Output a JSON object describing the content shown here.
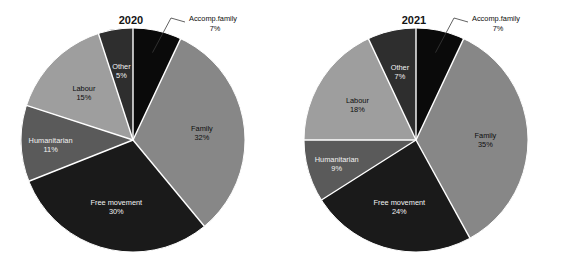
{
  "chart_data": [
    {
      "type": "pie",
      "title": "2020",
      "categories": [
        "Accomp.family",
        "Family",
        "Free movement",
        "Humanitarian",
        "Labour",
        "Other"
      ],
      "values": [
        7,
        32,
        30,
        11,
        15,
        5
      ],
      "value_labels": [
        "7%",
        "32%",
        "30%",
        "11%",
        "15%",
        "5%"
      ],
      "colors": [
        "#0a0a0a",
        "#878787",
        "#1a1a1a",
        "#5a5a5a",
        "#9e9e9e",
        "#2e2e2e"
      ],
      "label_text_colors": [
        "#0d0d0d",
        "#0d0d0d",
        "#f2f2f2",
        "#f2f2f2",
        "#0d0d0d",
        "#f2f2f2"
      ],
      "legend": "none",
      "grid": false,
      "start_angle_deg": 0,
      "direction": "clockwise"
    },
    {
      "type": "pie",
      "title": "2021",
      "categories": [
        "Accomp.family",
        "Family",
        "Free movement",
        "Humanitarian",
        "Labour",
        "Other"
      ],
      "values": [
        7,
        35,
        24,
        9,
        18,
        7
      ],
      "value_labels": [
        "7%",
        "35%",
        "24%",
        "9%",
        "18%",
        "7%"
      ],
      "colors": [
        "#0a0a0a",
        "#878787",
        "#1a1a1a",
        "#5a5a5a",
        "#9e9e9e",
        "#2e2e2e"
      ],
      "label_text_colors": [
        "#0d0d0d",
        "#0d0d0d",
        "#f2f2f2",
        "#f2f2f2",
        "#0d0d0d",
        "#f2f2f2"
      ],
      "legend": "none",
      "grid": false,
      "start_angle_deg": 0,
      "direction": "clockwise"
    }
  ],
  "figure": {
    "background": "#ffffff",
    "separator_color": "#ffffff",
    "title_color": "#141414"
  },
  "charts": [
    {
      "id": "chart-2020",
      "title": "2020",
      "slices": [
        {
          "name": "Accomp.family",
          "label": "Accomp.family",
          "percent": "7%",
          "color": "#0a0a0a",
          "placement": "outside"
        },
        {
          "name": "Family",
          "label": "Family",
          "percent": "32%",
          "color": "#878787",
          "placement": "inside-light"
        },
        {
          "name": "Free movement",
          "label": "Free movement",
          "percent": "30%",
          "color": "#1a1a1a",
          "placement": "inside-dark"
        },
        {
          "name": "Humanitarian",
          "label": "Humanitarian",
          "percent": "11%",
          "color": "#5a5a5a",
          "placement": "inside-dark"
        },
        {
          "name": "Labour",
          "label": "Labour",
          "percent": "15%",
          "color": "#9e9e9e",
          "placement": "inside-light"
        },
        {
          "name": "Other",
          "label": "Other",
          "percent": "5%",
          "color": "#2e2e2e",
          "placement": "inside-dark"
        }
      ]
    },
    {
      "id": "chart-2021",
      "title": "2021",
      "slices": [
        {
          "name": "Accomp.family",
          "label": "Accomp.family",
          "percent": "7%",
          "color": "#0a0a0a",
          "placement": "outside"
        },
        {
          "name": "Family",
          "label": "Family",
          "percent": "35%",
          "color": "#878787",
          "placement": "inside-light"
        },
        {
          "name": "Free movement",
          "label": "Free movement",
          "percent": "24%",
          "color": "#1a1a1a",
          "placement": "inside-dark"
        },
        {
          "name": "Humanitarian",
          "label": "Humanitarian",
          "percent": "9%",
          "color": "#5a5a5a",
          "placement": "inside-dark"
        },
        {
          "name": "Labour",
          "label": "Labour",
          "percent": "18%",
          "color": "#9e9e9e",
          "placement": "inside-light"
        },
        {
          "name": "Other",
          "label": "Other",
          "percent": "7%",
          "color": "#2e2e2e",
          "placement": "inside-dark"
        }
      ]
    }
  ]
}
